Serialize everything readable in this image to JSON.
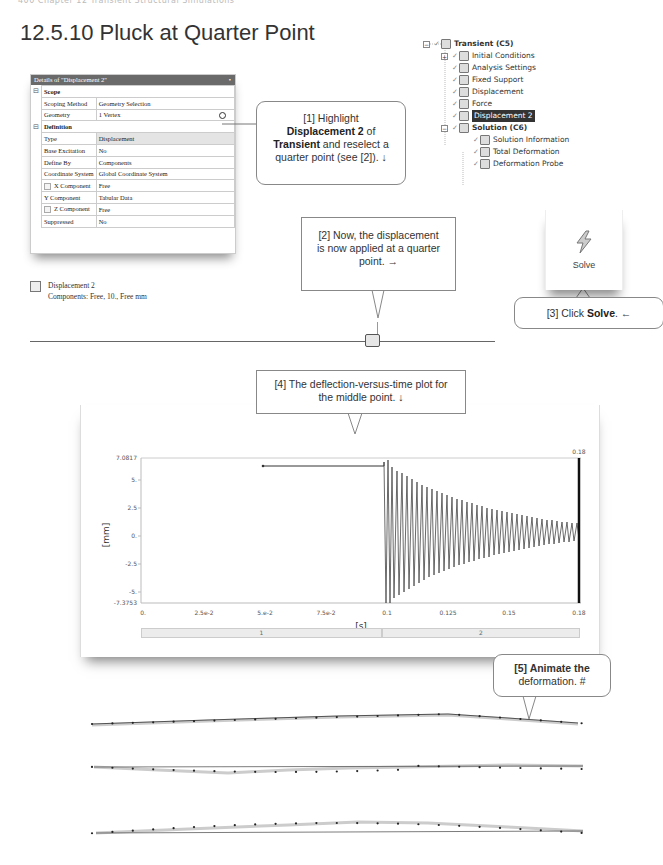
{
  "page": {
    "running_head": "400  Chapter 12  Transient Structural Simulations",
    "section_title": "12.5.10  Pluck at Quarter Point"
  },
  "details_panel": {
    "title": "Details of \"Displacement 2\"",
    "pin_icon": "pin-icon",
    "sections": [
      {
        "name": "Scope",
        "rows": [
          {
            "key": "Scoping Method",
            "value": "Geometry Selection"
          },
          {
            "key": "Geometry",
            "value": "1 Vertex"
          }
        ]
      },
      {
        "name": "Definition",
        "rows": [
          {
            "key": "Type",
            "value": "Displacement"
          },
          {
            "key": "Base Excitation",
            "value": "No"
          },
          {
            "key": "Define By",
            "value": "Components"
          },
          {
            "key": "Coordinate System",
            "value": "Global Coordinate System"
          },
          {
            "key": "X Component",
            "value": "Free"
          },
          {
            "key": "Y Component",
            "value": "Tabular Data"
          },
          {
            "key": "Z Component",
            "value": "Free"
          },
          {
            "key": "Suppressed",
            "value": "No"
          }
        ]
      }
    ]
  },
  "legend": {
    "name": "Displacement 2",
    "detail": "Components: Free, 10., Free mm"
  },
  "callouts": {
    "c1": {
      "prefix": "[1] Highlight",
      "bold1": "Displacement 2",
      "mid": " of",
      "bold2": "Transient",
      "rest": " and reselect a",
      "line4": "quarter point (see [2]). ↓"
    },
    "c2": {
      "line1": "[2] Now, the displacement",
      "line2": "is now applied at a quarter",
      "line3": "point. →"
    },
    "c3": {
      "prefix": "[3] Click ",
      "bold": "Solve",
      "suffix": ". ←"
    },
    "c4": {
      "line1": "[4] The deflection-versus-time plot for",
      "line2": "the middle point. ↓"
    },
    "c5": {
      "bold": "[5] Animate the",
      "line2": "deformation. #"
    }
  },
  "tree": {
    "items": [
      {
        "label": "Transient (C5)",
        "bold": true,
        "icon": "transient-icon",
        "level": 0,
        "expander": "−"
      },
      {
        "label": "Initial Conditions",
        "icon": "initial-conditions-icon",
        "level": 1,
        "expander": "+"
      },
      {
        "label": "Analysis Settings",
        "icon": "analysis-settings-icon",
        "level": 1
      },
      {
        "label": "Fixed Support",
        "icon": "fixed-support-icon",
        "level": 1
      },
      {
        "label": "Displacement",
        "icon": "displacement-icon",
        "level": 1
      },
      {
        "label": "Force",
        "icon": "force-icon",
        "level": 1
      },
      {
        "label": "Displacement 2",
        "icon": "displacement-icon",
        "level": 1,
        "selected": true
      },
      {
        "label": "Solution (C6)",
        "bold": true,
        "icon": "solution-icon",
        "level": 1,
        "expander": "−"
      },
      {
        "label": "Solution Information",
        "icon": "solution-information-icon",
        "level": 2
      },
      {
        "label": "Total Deformation",
        "icon": "total-deformation-icon",
        "level": 2
      },
      {
        "label": "Deformation Probe",
        "icon": "deformation-probe-icon",
        "level": 2
      }
    ]
  },
  "solve_button": {
    "label": "Solve",
    "icon": "lightning-bolt-icon"
  },
  "chart_data": {
    "type": "line",
    "xlabel": "[s]",
    "ylabel": "[mm]",
    "xlim": [
      0,
      0.18
    ],
    "ylim": [
      -7.3753,
      7.0817
    ],
    "x_ticks": [
      "0.",
      "2.5e-2",
      "5.e-2",
      "7.5e-2",
      "0.1",
      "0.125",
      "0.15",
      "0.18"
    ],
    "y_ticks": [
      "7.0817",
      "5.",
      "2.5",
      "0.",
      "-2.5",
      "-5.",
      "-7.3753"
    ],
    "current_time_marker": "0.18",
    "steps": [
      "1",
      "2"
    ],
    "series": [
      {
        "name": "Deformation Probe (Y)",
        "description": "Linear ramp to ~6.4 mm held from 0.05 s to 0.1 s, then released into a decaying oscillation between ~+7.08 and ~-7.38 mm, decaying to roughly ±1 mm by 0.18 s",
        "x": [
          0.05,
          0.1,
          0.1,
          0.101,
          0.102,
          0.11,
          0.12,
          0.13,
          0.14,
          0.15,
          0.16,
          0.17,
          0.18
        ],
        "y": [
          6.4,
          6.4,
          7.08,
          -7.38,
          7.0,
          5.8,
          4.5,
          3.4,
          2.6,
          2.0,
          1.5,
          1.2,
          0.9
        ]
      }
    ],
    "grid": false
  }
}
